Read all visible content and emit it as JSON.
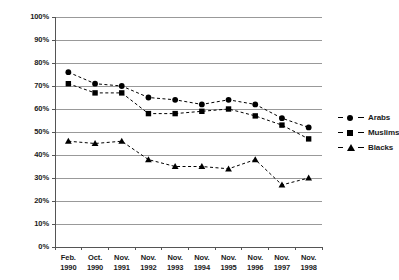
{
  "chart_data": {
    "type": "line",
    "title": "",
    "subtitle": "",
    "xlabel": "",
    "ylabel": "",
    "ylim": [
      0,
      100
    ],
    "ytick_labels": [
      "0%",
      "10%",
      "20%",
      "30%",
      "40%",
      "50%",
      "60%",
      "70%",
      "80%",
      "90%",
      "100%"
    ],
    "ytick_values": [
      0,
      10,
      20,
      30,
      40,
      50,
      60,
      70,
      80,
      90,
      100
    ],
    "grid": "horizontal",
    "legend_position": "right",
    "categories": [
      "Feb. 1990",
      "Oct. 1990",
      "Nov. 1991",
      "Nov. 1992",
      "Nov. 1993",
      "Nov. 1994",
      "Nov. 1995",
      "Nov. 1996",
      "Nov. 1997",
      "Nov. 1998"
    ],
    "category_lines": [
      [
        "Feb.",
        "1990"
      ],
      [
        "Oct.",
        "1990"
      ],
      [
        "Nov.",
        "1991"
      ],
      [
        "Nov.",
        "1992"
      ],
      [
        "Nov.",
        "1993"
      ],
      [
        "Nov.",
        "1994"
      ],
      [
        "Nov.",
        "1995"
      ],
      [
        "Nov.",
        "1996"
      ],
      [
        "Nov.",
        "1997"
      ],
      [
        "Nov.",
        "1998"
      ]
    ],
    "series": [
      {
        "name": "Arabs",
        "marker": "circle",
        "line_style": "dashed",
        "color": "#000000",
        "values": [
          76,
          71,
          70,
          65,
          64,
          62,
          64,
          62,
          56,
          52
        ]
      },
      {
        "name": "Muslims",
        "marker": "square",
        "line_style": "dashed",
        "color": "#000000",
        "values": [
          71,
          67,
          67,
          58,
          58,
          59,
          60,
          57,
          53,
          47
        ]
      },
      {
        "name": "Blacks",
        "marker": "triangle",
        "line_style": "dashed",
        "color": "#000000",
        "values": [
          46,
          45,
          46,
          38,
          35,
          35,
          34,
          38,
          27,
          30
        ]
      }
    ]
  },
  "style": {
    "grid_color": "#999999",
    "axis_color": "#555555",
    "text_color": "#1a1a1a",
    "background": "#ffffff"
  }
}
